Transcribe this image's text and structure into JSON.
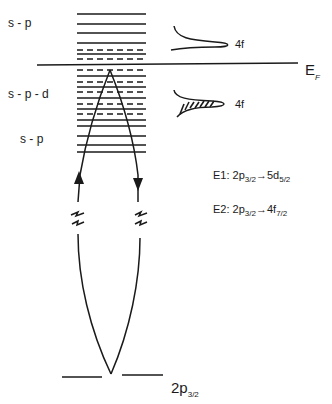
{
  "diagram": {
    "band_labels": [
      {
        "id": "sp-upper",
        "text": "s - p"
      },
      {
        "id": "spd",
        "text": "s - p - d"
      },
      {
        "id": "sp-lower",
        "text": "s - p"
      }
    ],
    "fermi_level": {
      "main": "E",
      "sub": "F"
    },
    "f_states": [
      {
        "id": "4f-unoccupied",
        "text": "4f",
        "filled": false
      },
      {
        "id": "4f-occupied",
        "text": "4f",
        "filled": true
      }
    ],
    "transitions": [
      {
        "id": "E1",
        "prefix": "E1: 2p",
        "from_sub": "3/2",
        "arrow": "→",
        "to": "5d",
        "to_sub": "5/2"
      },
      {
        "id": "E2",
        "prefix": "E2: 2p",
        "from_sub": "3/2",
        "arrow": "→",
        "to": "4f",
        "to_sub": "7/2"
      }
    ],
    "core_level": {
      "main": "2p",
      "sub": "3/2"
    },
    "levels": {
      "above_ef_solid": [
        14,
        24,
        33,
        43,
        54
      ],
      "above_ef_dashed": [
        50,
        59
      ],
      "below_ef_dashed": [
        70,
        82,
        92,
        104,
        114
      ],
      "below_ef_solid": [
        76,
        87,
        98,
        109,
        120,
        126,
        136,
        145,
        152
      ]
    },
    "colors": {
      "ink": "#1a1a1a",
      "background": "#ffffff"
    }
  }
}
